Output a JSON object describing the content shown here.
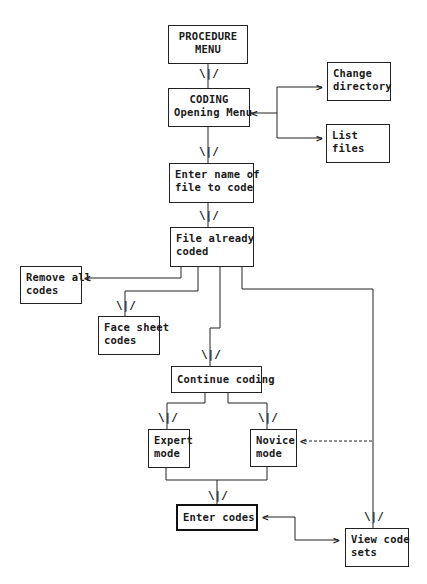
{
  "nodes": {
    "procedure_menu": {
      "line1": "PROCEDURE",
      "line2": "MENU"
    },
    "coding_opening": {
      "line1": "CODING",
      "line2": "Opening Menu"
    },
    "change_directory": {
      "line1": "Change",
      "line2": "directory"
    },
    "list_files": {
      "line1": "List",
      "line2": "files"
    },
    "enter_name": {
      "line1": "Enter name of",
      "line2": "file to code"
    },
    "file_already_coded": {
      "line1": "File already",
      "line2": "coded"
    },
    "remove_all_codes": {
      "line1": "Remove all",
      "line2": "codes"
    },
    "face_sheet_codes": {
      "line1": "Face sheet",
      "line2": "codes"
    },
    "continue_coding": {
      "line1": "Continue coding"
    },
    "expert_mode": {
      "line1": "Expert",
      "line2": "mode"
    },
    "novice_mode": {
      "line1": "Novice",
      "line2": "mode"
    },
    "enter_codes": {
      "line1": "Enter codes"
    },
    "view_code_sets": {
      "line1": "View code",
      "line2": "sets"
    }
  },
  "arrow_glyph": "\\|/",
  "side_arrow_left": "<",
  "side_arrow_right": ">",
  "colors": {
    "line": "#222222",
    "background": "#ffffff"
  }
}
